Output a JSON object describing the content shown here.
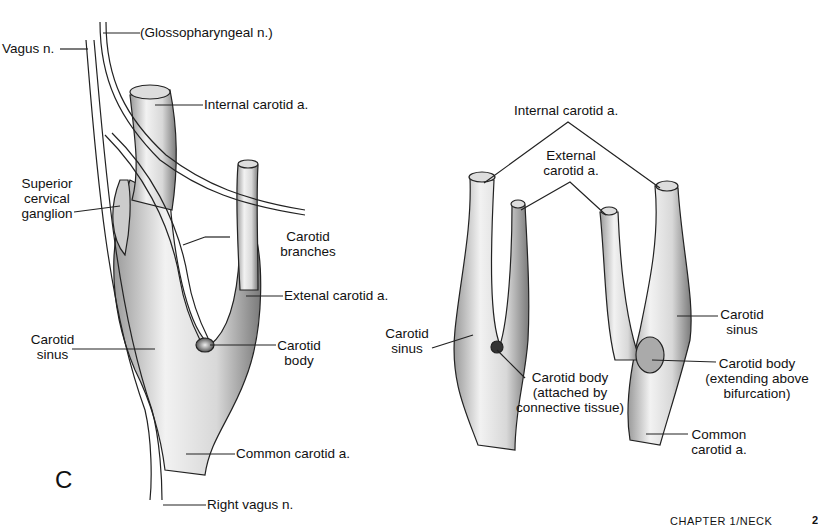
{
  "figure_letter": "C",
  "left_figure": {
    "labels": {
      "vagus": "Vagus n.",
      "glossopharyngeal": "(Glossopharyngeal n.)",
      "internal_carotid": "Internal carotid a.",
      "superior_cervical_ganglion": [
        "Superior",
        "cervical",
        "ganglion"
      ],
      "carotid_branches": [
        "Carotid",
        "branches"
      ],
      "external_carotid": "Extenal carotid a.",
      "carotid_sinus": [
        "Carotid",
        "sinus"
      ],
      "carotid_body": [
        "Carotid",
        "body"
      ],
      "common_carotid": "Common carotid a.",
      "right_vagus": "Right vagus n."
    }
  },
  "right_figure": {
    "labels": {
      "internal_carotid": "Internal carotid a.",
      "external_carotid": [
        "External",
        "carotid a."
      ],
      "carotid_sinus_left": [
        "Carotid",
        "sinus"
      ],
      "carotid_sinus_right": [
        "Carotid",
        "sinus"
      ],
      "carotid_body_attached": [
        "Carotid body",
        "(attached by",
        "connective tissue)"
      ],
      "carotid_body_extending": [
        "Carotid body",
        "(extending above",
        "bifurcation)"
      ],
      "common_carotid": [
        "Common",
        "carotid a."
      ]
    }
  },
  "footer": {
    "running_head": "CHAPTER 1/NECK",
    "page_number": "2"
  }
}
